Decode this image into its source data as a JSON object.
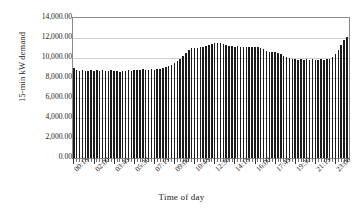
{
  "chart_data": {
    "type": "bar",
    "title": "",
    "xlabel": "Time of day",
    "ylabel": "15-min kW demand",
    "ylim": [
      0,
      14000
    ],
    "ytick_labels": [
      "14,000.00",
      "12,000.00",
      "10,000.00",
      "8,000.00",
      "6,000.00",
      "4,000.00",
      "2,000.00",
      "0.00"
    ],
    "ytick_values": [
      14000,
      12000,
      10000,
      8000,
      6000,
      4000,
      2000,
      0
    ],
    "grid": true,
    "legend": null,
    "xtick_labels": [
      "00:15",
      "02:00",
      "03:45",
      "05:30",
      "07:15",
      "09:00",
      "10:45",
      "12:30",
      "14:15",
      "16:00",
      "17:45",
      "19:30",
      "21:15",
      "23:00"
    ],
    "xtick_label_interval": 7,
    "bar_count": 96,
    "categories": [
      "00:15",
      "00:30",
      "00:45",
      "01:00",
      "01:15",
      "01:30",
      "01:45",
      "02:00",
      "02:15",
      "02:30",
      "02:45",
      "03:00",
      "03:15",
      "03:30",
      "03:45",
      "04:00",
      "04:15",
      "04:30",
      "04:45",
      "05:00",
      "05:15",
      "05:30",
      "05:45",
      "06:00",
      "06:15",
      "06:30",
      "06:45",
      "07:00",
      "07:15",
      "07:30",
      "07:45",
      "08:00",
      "08:15",
      "08:30",
      "08:45",
      "09:00",
      "09:15",
      "09:30",
      "09:45",
      "10:00",
      "10:15",
      "10:30",
      "10:45",
      "11:00",
      "11:15",
      "11:30",
      "11:45",
      "12:00",
      "12:15",
      "12:30",
      "12:45",
      "13:00",
      "13:15",
      "13:30",
      "13:45",
      "14:00",
      "14:15",
      "14:30",
      "14:45",
      "15:00",
      "15:15",
      "15:30",
      "15:45",
      "16:00",
      "16:15",
      "16:30",
      "16:45",
      "17:00",
      "17:15",
      "17:30",
      "17:45",
      "18:00",
      "18:15",
      "18:30",
      "18:45",
      "19:00",
      "19:15",
      "19:30",
      "19:45",
      "20:00",
      "20:15",
      "20:30",
      "20:45",
      "21:00",
      "21:15",
      "21:30",
      "21:45",
      "22:00",
      "22:15",
      "22:30",
      "22:45",
      "23:00",
      "23:15",
      "23:30",
      "23:45",
      "00:00"
    ],
    "values": [
      9000,
      8850,
      8700,
      8800,
      8750,
      8700,
      8800,
      8750,
      8850,
      8700,
      8800,
      8750,
      8700,
      8800,
      8750,
      8700,
      8650,
      8700,
      8750,
      8800,
      8700,
      8800,
      8850,
      8800,
      8900,
      8850,
      8800,
      8900,
      8850,
      8950,
      8900,
      9000,
      9100,
      9200,
      9350,
      9500,
      9700,
      9900,
      10200,
      10500,
      10800,
      11000,
      11050,
      11000,
      11100,
      11150,
      11200,
      11300,
      11400,
      11500,
      11550,
      11500,
      11450,
      11350,
      11250,
      11200,
      11150,
      11200,
      11150,
      11100,
      11150,
      11100,
      11150,
      11100,
      11100,
      11050,
      10900,
      10700,
      10600,
      10650,
      10600,
      10550,
      10400,
      10250,
      10100,
      10000,
      9950,
      9900,
      9850,
      9900,
      9850,
      9900,
      9850,
      9900,
      9800,
      9850,
      9900,
      9850,
      9900,
      9950,
      10100,
      10400,
      10800,
      11300,
      11800,
      12100
    ],
    "values_tail": [
      12250,
      12200,
      12150,
      12000,
      11900,
      11800,
      11650,
      11500,
      11300,
      11100,
      10850,
      10600,
      10400,
      10200,
      9950,
      9700,
      9450,
      9200,
      8950,
      8700,
      8500,
      8300,
      8200
    ],
    "peak_morning": 11550,
    "peak_evening": 12250,
    "min_value": 8200,
    "colors": {
      "bar": "#1c1c1c",
      "grid": "#cfcfcf",
      "frame": "#8a8a8a",
      "text": "#1a1a1a",
      "background": "#ffffff"
    }
  }
}
